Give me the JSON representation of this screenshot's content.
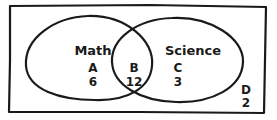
{
  "diagram": {
    "type": "venn",
    "sets": [
      {
        "name": "Math",
        "region_label": "A",
        "count": "6"
      },
      {
        "name": "Science",
        "region_label": "C",
        "count": "3"
      }
    ],
    "intersection": {
      "region_label": "B",
      "count": "12"
    },
    "outside": {
      "region_label": "D",
      "count": "2"
    },
    "colors": {
      "stroke": "#1a1a1a",
      "background": "#ffffff"
    }
  }
}
